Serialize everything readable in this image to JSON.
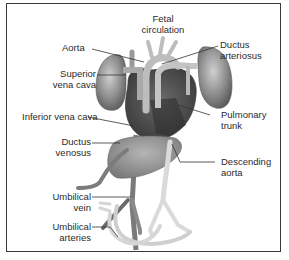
{
  "title": {
    "line1": "Fetal",
    "line2": "circulation"
  },
  "labels": {
    "aorta": "Aorta",
    "superior_vena_cava": [
      "Superior",
      "vena cava"
    ],
    "inferior_vena_cava": "Inferior vena cava",
    "ductus_venosus": [
      "Ductus",
      "venosus"
    ],
    "umbilical_vein": [
      "Umbilical",
      "vein"
    ],
    "umbilical_arteries": [
      "Umbilical",
      "arteries"
    ],
    "ductus_arteriosus": [
      "Ductus",
      "arteriosus"
    ],
    "pulmonary_trunk": [
      "Pulmonary",
      "trunk"
    ],
    "descending_aorta": [
      "Descending",
      "aorta"
    ]
  },
  "colors": {
    "border": "#3a3a3a",
    "lung": "#8a8a8a",
    "heart": "#4a4a4a",
    "vessel_light": "#c8c8c8",
    "vessel_dark": "#6e6e6e",
    "liver": "#9a9a9a",
    "text": "#2b2b2b"
  }
}
